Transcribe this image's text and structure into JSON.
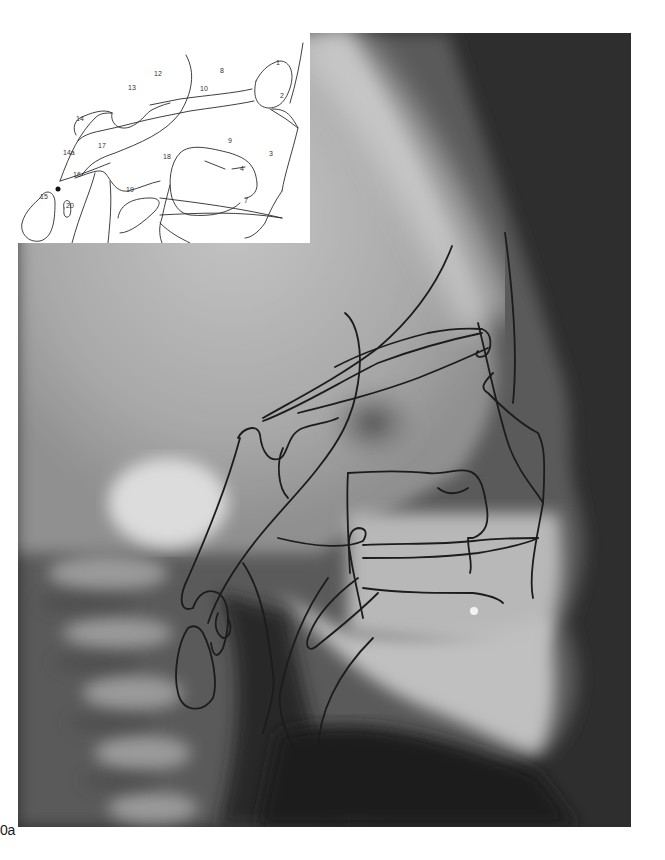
{
  "figure": {
    "label_top": "0b",
    "label_bottom": "0a",
    "panel_a": {
      "description": "Lateral cephalometric radiograph with superimposed anatomical tracing",
      "colors": {
        "background_dark": "#2b2b2b",
        "bone_light": "#d9d9d9",
        "tracing": "#1c1c1c"
      }
    },
    "panel_b": {
      "description": "Cephalometric tracing diagram with numbered anatomical structures",
      "structure_labels": [
        "1",
        "2",
        "3",
        "4",
        "7",
        "8",
        "9",
        "10",
        "12",
        "13",
        "14",
        "14a",
        "15",
        "16",
        "17",
        "18",
        "19",
        "20"
      ],
      "landmark_point": "14a"
    }
  }
}
